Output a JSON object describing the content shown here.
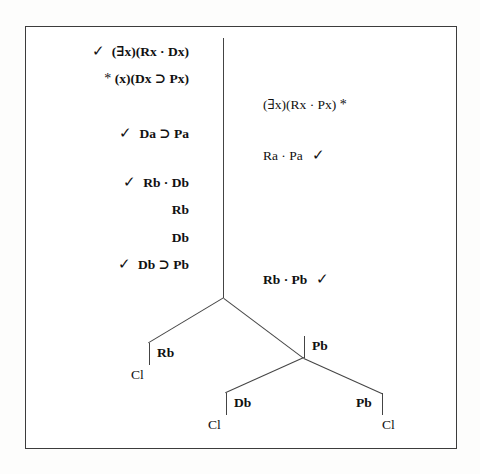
{
  "figure": {
    "type": "truth-tree",
    "border_color": "#3c3c3c",
    "line_color": "#444444",
    "text_color": "#111111",
    "check_glyph": "✓",
    "asterisk": "*"
  },
  "trunk": {
    "left_column": [
      {
        "check": "✓",
        "text": "(∃x)(Rx · Dx)",
        "star": ""
      },
      {
        "check": "",
        "text": "(x)(Dx ⊃ Px)",
        "star": "*"
      },
      {
        "check": "✓",
        "text": "Da ⊃ Pa",
        "star": ""
      },
      {
        "check": "✓",
        "text": "Rb · Db",
        "star": ""
      },
      {
        "check": "",
        "text": "Rb",
        "star": ""
      },
      {
        "check": "",
        "text": "Db",
        "star": ""
      },
      {
        "check": "✓",
        "text": "Db ⊃ Pb",
        "star": ""
      }
    ],
    "right_column": [
      {
        "text": "(∃x)(Rx · Px)",
        "star": "*",
        "check": ""
      },
      {
        "text": "Ra · Pa",
        "star": "",
        "check": "✓"
      },
      {
        "text": "Rb · Pb",
        "star": "",
        "check": "✓"
      }
    ]
  },
  "branches": {
    "upper_left": {
      "label": "Rb",
      "closed": "Cl"
    },
    "upper_right": {
      "label": "Pb",
      "closed": ""
    },
    "lower_left": {
      "label": "Db",
      "closed": "Cl"
    },
    "lower_right": {
      "label": "Pb",
      "closed": "Cl"
    }
  }
}
